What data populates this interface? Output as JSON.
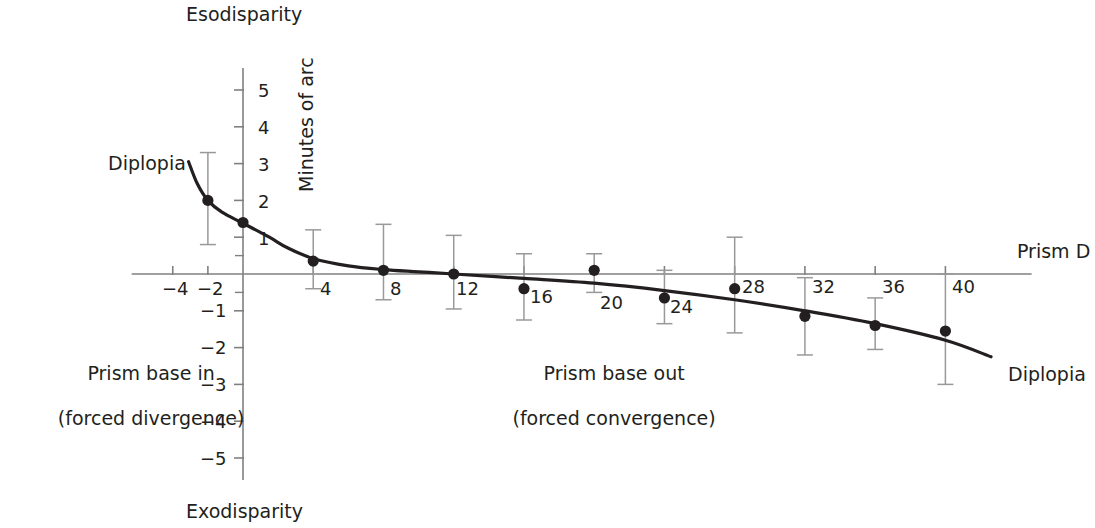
{
  "chart_data": {
    "type": "scatter",
    "title": "",
    "subtitle": "",
    "xlabel": "Prism D",
    "ylabel": "Minutes of arc",
    "top_label": "Esodisparity",
    "bottom_label": "Exodisparity",
    "xlim": [
      -6,
      44
    ],
    "ylim": [
      -5.6,
      5.6
    ],
    "grid": false,
    "legend": null,
    "x_ticks": [
      -4,
      -2,
      0,
      4,
      8,
      12,
      16,
      20,
      24,
      28,
      32,
      36,
      40
    ],
    "x_tick_labels": [
      "−4",
      "−2",
      "",
      "4",
      "8",
      "12",
      "16",
      "20",
      "24",
      "28",
      "32",
      "36",
      "40"
    ],
    "y_ticks": [
      5,
      4,
      3,
      2,
      1,
      -1,
      -2,
      -3,
      -4,
      -5
    ],
    "y_tick_labels": [
      "5",
      "4",
      "3",
      "2",
      "1",
      "−1",
      "−2",
      "−3",
      "−4",
      "−5"
    ],
    "points": [
      {
        "x": -2,
        "y": 2.0,
        "err_low": 0.8,
        "err_high": 3.3
      },
      {
        "x": 0,
        "y": 1.4,
        "err_low": 1.4,
        "err_high": 1.4
      },
      {
        "x": 4,
        "y": 0.35,
        "err_low": -0.4,
        "err_high": 1.2
      },
      {
        "x": 8,
        "y": 0.1,
        "err_low": -0.7,
        "err_high": 1.35
      },
      {
        "x": 12,
        "y": 0.0,
        "err_low": -0.95,
        "err_high": 1.05
      },
      {
        "x": 16,
        "y": -0.4,
        "err_low": -1.25,
        "err_high": 0.55
      },
      {
        "x": 20,
        "y": 0.1,
        "err_low": -0.5,
        "err_high": 0.55
      },
      {
        "x": 24,
        "y": -0.65,
        "err_low": -1.35,
        "err_high": 0.1
      },
      {
        "x": 28,
        "y": -0.4,
        "err_low": -1.6,
        "err_high": 1.0
      },
      {
        "x": 32,
        "y": -1.15,
        "err_low": -2.2,
        "err_high": -0.1
      },
      {
        "x": 36,
        "y": -1.4,
        "err_low": -2.05,
        "err_high": -0.65
      },
      {
        "x": 40,
        "y": -1.55,
        "err_low": -3.0,
        "err_high": 0.0
      }
    ],
    "fit_curve": [
      {
        "x": -3.1,
        "y": 3.05
      },
      {
        "x": -2.6,
        "y": 2.45
      },
      {
        "x": -2.0,
        "y": 2.0
      },
      {
        "x": -1.2,
        "y": 1.68
      },
      {
        "x": 0.0,
        "y": 1.38
      },
      {
        "x": 1.5,
        "y": 1.0
      },
      {
        "x": 2.5,
        "y": 0.72
      },
      {
        "x": 4.0,
        "y": 0.42
      },
      {
        "x": 6.0,
        "y": 0.22
      },
      {
        "x": 8.0,
        "y": 0.12
      },
      {
        "x": 10.0,
        "y": 0.06
      },
      {
        "x": 12.0,
        "y": 0.0
      },
      {
        "x": 16.0,
        "y": -0.12
      },
      {
        "x": 20.0,
        "y": -0.25
      },
      {
        "x": 24.0,
        "y": -0.45
      },
      {
        "x": 28.0,
        "y": -0.7
      },
      {
        "x": 32.0,
        "y": -1.0
      },
      {
        "x": 36.0,
        "y": -1.35
      },
      {
        "x": 40.0,
        "y": -1.8
      },
      {
        "x": 42.6,
        "y": -2.25
      }
    ],
    "annotations": [
      {
        "name": "diplopia-left",
        "text": "Diplopia",
        "x": -5.6,
        "y": 3.35
      },
      {
        "name": "diplopia-right",
        "text": "Diplopia",
        "x": 42.2,
        "y": -2.75
      }
    ],
    "region_labels": [
      {
        "name": "prism-base-in",
        "line1": "Prism base in",
        "line2": "(forced divergence)"
      },
      {
        "name": "prism-base-out",
        "line1": "Prism base out",
        "line2": "(forced convergence)"
      }
    ],
    "style": {
      "axis_color": "#808080",
      "curve_color": "#231f20",
      "point_color": "#231f20",
      "errorbar_color": "#999999",
      "text_color": "#231f20",
      "background": "#ffffff"
    }
  },
  "labels": {
    "esodisparity": "Esodisparity",
    "exodisparity": "Exodisparity",
    "minutes_of_arc": "Minutes of arc",
    "prism_d": "Prism D",
    "diplopia_left": "Diplopia",
    "diplopia_right": "Diplopia",
    "base_in_line1": "Prism base in",
    "base_in_line2": "(forced divergence)",
    "base_out_line1": "Prism base out",
    "base_out_line2": "(forced convergence)"
  },
  "x_tick_text": {
    "m4": "−4",
    "m2": "−2",
    "t4": "4",
    "t8": "8",
    "t12": "12",
    "t16": "16",
    "t20": "20",
    "t24": "24",
    "t28": "28",
    "t32": "32",
    "t36": "36",
    "t40": "40"
  },
  "y_tick_text": {
    "p5": "5",
    "p4": "4",
    "p3": "3",
    "p2": "2",
    "p1": "1",
    "m1": "−1",
    "m2": "−2",
    "m3": "−3",
    "m4": "−4",
    "m5": "−5"
  }
}
